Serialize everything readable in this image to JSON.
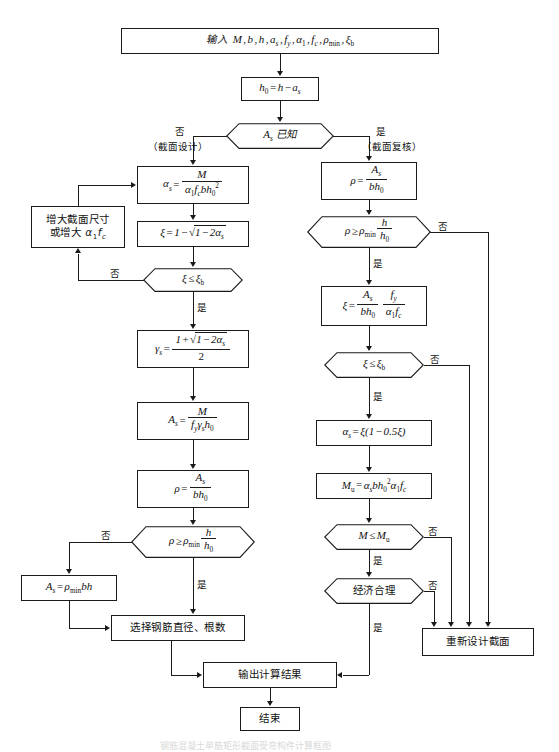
{
  "diagram": {
    "title": "钢筋混凝土单筋矩形截面受弯构件计算框图",
    "nodes": {
      "input": {
        "label": "输入 M, b, h, as, fy, α1, fc, ρmin, ξb"
      },
      "h0": {
        "label": "h0 = h − as"
      },
      "as_known": {
        "label": "As 已知"
      },
      "alpha_s_calc": {
        "label": "αs = M / (α1 fc b h0²)"
      },
      "xi_calc_left": {
        "label": "ξ = 1 − √(1 − 2αs)"
      },
      "enlarge": {
        "line1": "增大截面尺寸",
        "line2": "或增大 α1fc"
      },
      "xi_check_left": {
        "label": "ξ ≤ ξb"
      },
      "gamma_s": {
        "label": "γs = (1 + √(1 − 2αs)) / 2"
      },
      "as_calc": {
        "label": "As = M / (fy γs h0)"
      },
      "rho_left": {
        "label": "ρ = As / (b h0)"
      },
      "rho_check_left": {
        "label": "ρ ≥ ρmin h / h0"
      },
      "as_min": {
        "label": "As = ρmin b h"
      },
      "select_bars": {
        "label": "选择钢筋直径、根数"
      },
      "output": {
        "label": "输出计算结果"
      },
      "end": {
        "label": "结束"
      },
      "rho_right": {
        "label": "ρ = As / (b h0)"
      },
      "rho_check_right": {
        "label": "ρ ≥ ρmin h / h0"
      },
      "xi_calc_right": {
        "label": "ξ = (As / b h0)(fy / α1 fc)"
      },
      "xi_check_right": {
        "label": "ξ ≤ ξb"
      },
      "alpha_s_right": {
        "label": "αs = ξ(1 − 0.5ξ)"
      },
      "mu_calc": {
        "label": "Mu = αs b h0² α1 fc"
      },
      "m_check": {
        "label": "M ≤ Mu"
      },
      "economic": {
        "label": "经济合理"
      },
      "redesign": {
        "label": "重新设计截面"
      }
    },
    "edge_labels": {
      "no_design": "否",
      "design_paren": "（截面设计）",
      "yes_check": "是",
      "check_paren": "（截面复核）",
      "no_enlarge": "否",
      "yes_xi_left": "是",
      "no_rho_left": "否",
      "yes_rho_left": "是",
      "no_rho_right": "否",
      "yes_rho_right": "是",
      "no_xi_right": "否",
      "yes_xi_right": "是",
      "no_m": "否",
      "yes_m": "是",
      "no_econ": "否",
      "yes_econ": "是"
    },
    "colors": {
      "stroke": "#1a1a1a",
      "background": "#ffffff"
    }
  }
}
